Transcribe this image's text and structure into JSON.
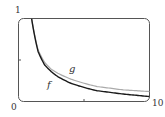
{
  "chart_data": {
    "type": "line",
    "title": "",
    "xlabel": "",
    "ylabel": "",
    "xlim": [
      0,
      10
    ],
    "ylim": [
      0,
      1
    ],
    "grid": false,
    "legend": "none (curves labeled inline)",
    "tick_labels": {
      "y_top": "1",
      "origin": "0",
      "x_right": "10"
    },
    "ticks": {
      "x": [
        5
      ],
      "y": [
        0.5
      ]
    },
    "series": [
      {
        "name": "f",
        "color": "#1a1a1a",
        "x": [
          1.0,
          1.5,
          2,
          2.5,
          3,
          4,
          5,
          6,
          7,
          8,
          9,
          10
        ],
        "values": [
          1.0,
          0.6,
          0.44,
          0.36,
          0.3,
          0.22,
          0.17,
          0.13,
          0.11,
          0.09,
          0.075,
          0.06
        ]
      },
      {
        "name": "g",
        "color": "#aaaaaa",
        "x": [
          1.0,
          1.5,
          2,
          2.5,
          3,
          4,
          5,
          6,
          7,
          8,
          9,
          10
        ],
        "values": [
          1.0,
          0.62,
          0.47,
          0.39,
          0.34,
          0.27,
          0.22,
          0.18,
          0.16,
          0.14,
          0.13,
          0.12
        ]
      }
    ],
    "annotations": [
      {
        "text": "f",
        "x": 2.9,
        "y": 0.22
      },
      {
        "text": "g",
        "x": 3.5,
        "y": 0.37
      }
    ]
  },
  "labels": {
    "y_top": "1",
    "origin": "0",
    "x_right": "10",
    "f": "f",
    "g": "g"
  }
}
